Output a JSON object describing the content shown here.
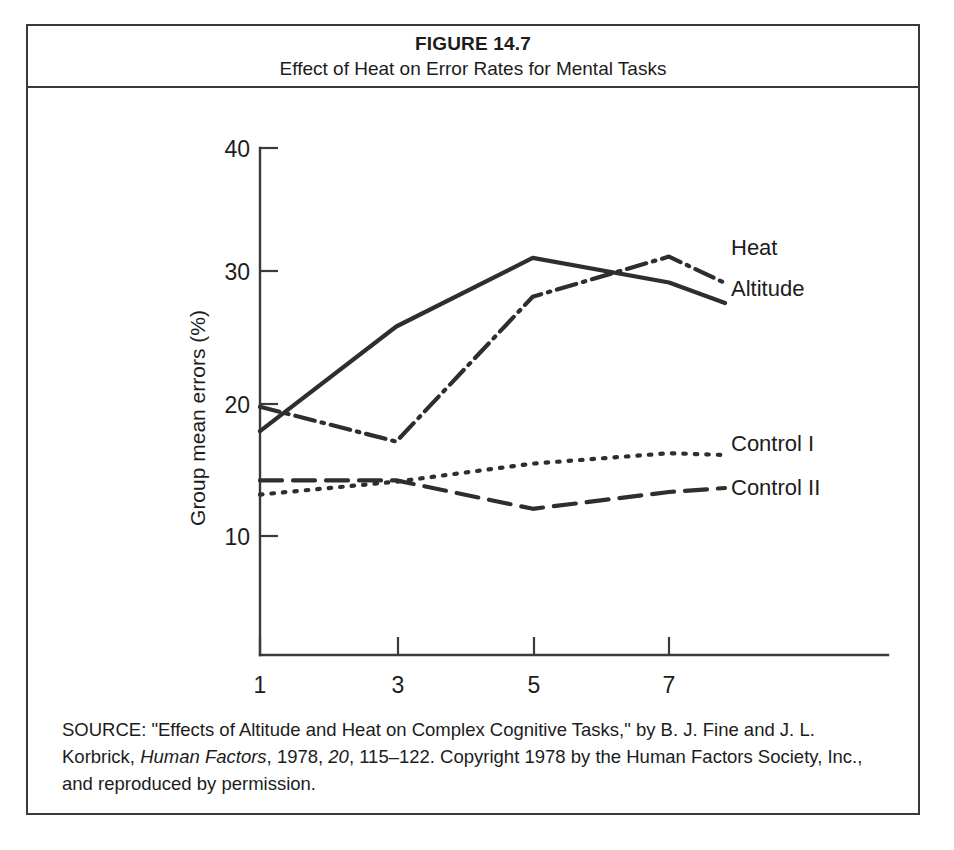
{
  "figure": {
    "number": "FIGURE 14.7",
    "title": "Effect of Heat on Error Rates for Mental Tasks"
  },
  "source": {
    "prefix": "SOURCE:",
    "part1": "\"Effects of Altitude and Heat on Complex Cognitive Tasks,\" by B. J. Fine and J. L. Korbrick, ",
    "journal": "Human Factors",
    "part2": ", 1978, ",
    "volume": "20",
    "part3": ", 115–122. Copyright 1978 by the Human Factors Society, Inc., and reproduced by permission."
  },
  "chart_data": {
    "type": "line",
    "title": "Effect of Heat on Error Rates for Mental Tasks",
    "xlabel": "Hours of exposure",
    "ylabel": "Group mean errors (%)",
    "x": [
      1,
      3,
      5,
      7
    ],
    "xlim": [
      0.6,
      7.9
    ],
    "ylim": [
      6.5,
      40
    ],
    "xticks": [
      1,
      3,
      5,
      7
    ],
    "xtick_labels": [
      "1",
      "3",
      "5",
      "7"
    ],
    "yticks": [
      10,
      20,
      30,
      40
    ],
    "ytick_labels": [
      "10",
      "20",
      "30",
      "40"
    ],
    "grid": false,
    "legend_position": "right-of-line-ends",
    "series": [
      {
        "name": "Heat",
        "label": "Heat",
        "style": "dash-dot",
        "color": "#2e2e2e",
        "values": [
          20.0,
          17.3,
          28.5,
          31.6
        ]
      },
      {
        "name": "Altitude",
        "label": "Altitude",
        "style": "solid",
        "color": "#2e2e2e",
        "values": [
          18.1,
          26.2,
          31.5,
          29.6
        ]
      },
      {
        "name": "Control I",
        "label": "Control I",
        "style": "dotted",
        "color": "#2e2e2e",
        "values": [
          13.2,
          14.2,
          15.6,
          16.4
        ]
      },
      {
        "name": "Control II",
        "label": "Control II",
        "style": "dashed",
        "color": "#2e2e2e",
        "values": [
          14.3,
          14.3,
          12.1,
          13.4
        ]
      }
    ]
  }
}
